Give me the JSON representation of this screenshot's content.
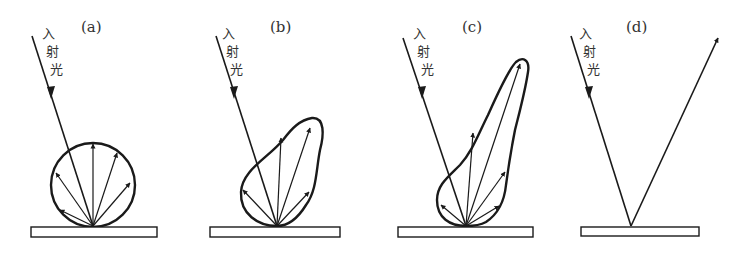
{
  "figure": {
    "panels": [
      {
        "id": "a",
        "label": "(a)",
        "incident_label": [
          "入",
          "射",
          "光"
        ],
        "type": "diffuse"
      },
      {
        "id": "b",
        "label": "(b)",
        "incident_label": [
          "入",
          "射",
          "光"
        ],
        "type": "mixed"
      },
      {
        "id": "c",
        "label": "(c)",
        "incident_label": [
          "入",
          "射",
          "光"
        ],
        "type": "directional-diffuse"
      },
      {
        "id": "d",
        "label": "(d)",
        "incident_label": [
          "入",
          "射",
          "光"
        ],
        "type": "specular"
      }
    ]
  }
}
